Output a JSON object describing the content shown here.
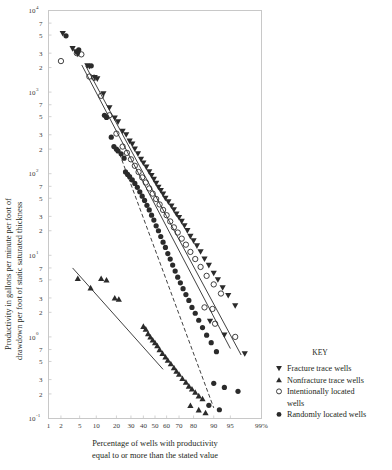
{
  "chart_data": {
    "type": "scatter",
    "title": "",
    "xlabel": "Percentage of wells with productivity equal to or more than the stated value",
    "ylabel": "Productivity in gallons per minute per foot of drawdown per foot of static saturated thickness",
    "x_scale": "probability",
    "y_scale": "log",
    "xlim": [
      1,
      99
    ],
    "ylim": [
      0.1,
      10000
    ],
    "grid": false,
    "legend_position": "right-bottom",
    "xticks": [
      {
        "value": 1,
        "label": "1"
      },
      {
        "value": 2,
        "label": "2"
      },
      {
        "value": 5,
        "label": "5"
      },
      {
        "value": 10,
        "label": "10"
      },
      {
        "value": 20,
        "label": "20"
      },
      {
        "value": 30,
        "label": "30"
      },
      {
        "value": 40,
        "label": "40"
      },
      {
        "value": 50,
        "label": "50"
      },
      {
        "value": 60,
        "label": "60"
      },
      {
        "value": 70,
        "label": "70"
      },
      {
        "value": 80,
        "label": "80"
      },
      {
        "value": 90,
        "label": "90"
      },
      {
        "value": 95,
        "label": "95"
      },
      {
        "value": 99,
        "label": "99%"
      }
    ],
    "yticks": [
      {
        "value": 10000,
        "label": "10",
        "exponent": "4"
      },
      {
        "value": 7000,
        "label": "7"
      },
      {
        "value": 5000,
        "label": "5"
      },
      {
        "value": 3000,
        "label": "3"
      },
      {
        "value": 2000,
        "label": "2"
      },
      {
        "value": 1000,
        "label": "10",
        "exponent": "3"
      },
      {
        "value": 700,
        "label": "7"
      },
      {
        "value": 500,
        "label": "5"
      },
      {
        "value": 300,
        "label": "3"
      },
      {
        "value": 200,
        "label": "2"
      },
      {
        "value": 100,
        "label": "10",
        "exponent": "2"
      },
      {
        "value": 70,
        "label": "7"
      },
      {
        "value": 50,
        "label": "5"
      },
      {
        "value": 30,
        "label": "3"
      },
      {
        "value": 20,
        "label": "2"
      },
      {
        "value": 10,
        "label": "10",
        "exponent": "1"
      },
      {
        "value": 7,
        "label": "7"
      },
      {
        "value": 5,
        "label": "5"
      },
      {
        "value": 3,
        "label": "3"
      },
      {
        "value": 2,
        "label": "2"
      },
      {
        "value": 1,
        "label": "10",
        "exponent": "0"
      },
      {
        "value": 0.7,
        "label": "7"
      },
      {
        "value": 0.5,
        "label": "5"
      },
      {
        "value": 0.3,
        "label": "3"
      },
      {
        "value": 0.2,
        "label": "2"
      },
      {
        "value": 0.1,
        "label": "10",
        "exponent": "-1"
      }
    ],
    "series": [
      {
        "name": "Fracture trace wells",
        "marker": "triangle-down",
        "fill": "#2b2b2b",
        "points": [
          [
            2.2,
            5200
          ],
          [
            3.6,
            3400
          ],
          [
            4.2,
            3100
          ],
          [
            4.6,
            2900
          ],
          [
            7.0,
            2100
          ],
          [
            7.6,
            2050
          ],
          [
            9.4,
            1500
          ],
          [
            10.4,
            1450
          ],
          [
            13.0,
            950
          ],
          [
            16.0,
            640
          ],
          [
            19.0,
            480
          ],
          [
            21.0,
            430
          ],
          [
            24.0,
            330
          ],
          [
            26.5,
            300
          ],
          [
            29.0,
            250
          ],
          [
            31.0,
            230
          ],
          [
            33.0,
            200
          ],
          [
            35.5,
            175
          ],
          [
            38.0,
            150
          ],
          [
            40.0,
            135
          ],
          [
            42.5,
            120
          ],
          [
            45.0,
            105
          ],
          [
            47.0,
            95
          ],
          [
            49.0,
            85
          ],
          [
            51.0,
            76
          ],
          [
            53.0,
            68
          ],
          [
            55.0,
            62
          ],
          [
            57.0,
            56
          ],
          [
            59.0,
            50
          ],
          [
            61.5,
            45
          ],
          [
            64.0,
            40
          ],
          [
            66.0,
            36
          ],
          [
            68.0,
            32
          ],
          [
            70.0,
            29
          ],
          [
            72.0,
            26
          ],
          [
            74.0,
            23
          ],
          [
            76.0,
            20
          ],
          [
            78.0,
            17
          ],
          [
            80.0,
            15
          ],
          [
            82.0,
            13
          ],
          [
            84.0,
            11
          ],
          [
            86.0,
            9.0
          ],
          [
            88.0,
            7.5
          ],
          [
            90.0,
            6.0
          ],
          [
            91.5,
            5.0
          ],
          [
            93.0,
            4.0
          ],
          [
            94.5,
            3.2
          ],
          [
            96.0,
            2.4
          ],
          [
            88.5,
            1.55
          ],
          [
            93.5,
            1.05
          ],
          [
            97.5,
            0.62
          ]
        ]
      },
      {
        "name": "Nonfracture trace wells",
        "marker": "triangle-up",
        "fill": "#2b2b2b",
        "points": [
          [
            4.6,
            5.2
          ],
          [
            8.0,
            4.0
          ],
          [
            12.0,
            5.2
          ],
          [
            14.5,
            5.0
          ],
          [
            19.0,
            3.0
          ],
          [
            21.5,
            2.9
          ],
          [
            40.0,
            1.35
          ],
          [
            42.0,
            1.25
          ],
          [
            44.0,
            1.1
          ],
          [
            46.0,
            1.0
          ],
          [
            48.0,
            0.92
          ],
          [
            50.0,
            0.85
          ],
          [
            52.0,
            0.78
          ],
          [
            54.0,
            0.7
          ],
          [
            56.5,
            0.63
          ],
          [
            59.0,
            0.57
          ],
          [
            61.0,
            0.52
          ],
          [
            63.5,
            0.47
          ],
          [
            66.0,
            0.42
          ],
          [
            68.0,
            0.38
          ],
          [
            70.0,
            0.35
          ],
          [
            72.5,
            0.31
          ],
          [
            75.0,
            0.28
          ],
          [
            77.0,
            0.25
          ],
          [
            79.0,
            0.23
          ],
          [
            81.0,
            0.21
          ],
          [
            83.0,
            0.19
          ],
          [
            85.0,
            0.175
          ],
          [
            78.0,
            0.145
          ],
          [
            83.0,
            0.128
          ],
          [
            86.5,
            0.118
          ]
        ]
      },
      {
        "name": "Intentionally located wells",
        "marker": "circle-open",
        "fill": "none",
        "points": [
          [
            2.0,
            2400
          ],
          [
            4.4,
            3000
          ],
          [
            5.4,
            2900
          ],
          [
            7.6,
            1550
          ],
          [
            9.2,
            1500
          ],
          [
            12.0,
            900
          ],
          [
            16.0,
            520
          ],
          [
            20.0,
            310
          ],
          [
            24.0,
            215
          ],
          [
            27.0,
            180
          ],
          [
            30.0,
            150
          ],
          [
            33.0,
            125
          ],
          [
            36.0,
            105
          ],
          [
            39.0,
            90
          ],
          [
            42.0,
            78
          ],
          [
            45.0,
            66
          ],
          [
            48.0,
            57
          ],
          [
            51.0,
            49
          ],
          [
            54.0,
            42
          ],
          [
            57.0,
            36
          ],
          [
            60.0,
            31
          ],
          [
            63.0,
            26
          ],
          [
            66.0,
            22
          ],
          [
            69.0,
            19
          ],
          [
            72.0,
            16
          ],
          [
            75.0,
            13.5
          ],
          [
            78.0,
            11.0
          ],
          [
            81.0,
            9.0
          ],
          [
            84.0,
            7.2
          ],
          [
            87.0,
            5.6
          ],
          [
            90.0,
            4.4
          ],
          [
            92.5,
            3.4
          ],
          [
            86.0,
            2.3
          ],
          [
            89.5,
            2.2
          ],
          [
            90.5,
            1.45
          ],
          [
            96.0,
            1.0
          ]
        ]
      },
      {
        "name": "Randomly located wells",
        "marker": "circle-filled",
        "fill": "#2b2b2b",
        "points": [
          [
            2.6,
            4900
          ],
          [
            4.8,
            3300
          ],
          [
            8.2,
            2100
          ],
          [
            13.5,
            520
          ],
          [
            14.5,
            490
          ],
          [
            17.0,
            280
          ],
          [
            18.5,
            215
          ],
          [
            20.0,
            200
          ],
          [
            21.0,
            190
          ],
          [
            23.0,
            175
          ],
          [
            25.0,
            155
          ],
          [
            26.0,
            105
          ],
          [
            27.5,
            98
          ],
          [
            29.0,
            92
          ],
          [
            31.0,
            84
          ],
          [
            33.0,
            76
          ],
          [
            35.0,
            68
          ],
          [
            37.0,
            60
          ],
          [
            39.0,
            53
          ],
          [
            41.0,
            47
          ],
          [
            43.0,
            41
          ],
          [
            45.0,
            36
          ],
          [
            47.0,
            31
          ],
          [
            49.0,
            27
          ],
          [
            51.0,
            23
          ],
          [
            53.0,
            20
          ],
          [
            55.0,
            17
          ],
          [
            57.0,
            14.5
          ],
          [
            59.0,
            12.5
          ],
          [
            61.0,
            10.5
          ],
          [
            63.0,
            9.0
          ],
          [
            65.0,
            7.6
          ],
          [
            67.0,
            6.4
          ],
          [
            69.0,
            5.4
          ],
          [
            71.0,
            4.6
          ],
          [
            73.0,
            3.9
          ],
          [
            75.0,
            3.3
          ],
          [
            77.0,
            2.8
          ],
          [
            79.0,
            2.3
          ],
          [
            81.0,
            1.95
          ],
          [
            83.0,
            1.6
          ],
          [
            85.0,
            1.3
          ],
          [
            87.0,
            1.05
          ],
          [
            89.0,
            0.85
          ],
          [
            91.0,
            0.66
          ],
          [
            90.0,
            0.27
          ],
          [
            93.5,
            0.24
          ],
          [
            96.5,
            0.215
          ],
          [
            88.0,
            0.145
          ],
          [
            92.0,
            0.128
          ]
        ]
      }
    ],
    "trend_lines": [
      {
        "name": "fracture-trace-trend",
        "style": "solid",
        "from": [
          6.5,
          2100
        ],
        "to": [
          97.0,
          0.6
        ]
      },
      {
        "name": "intentionally-located-trend",
        "style": "solid",
        "from": [
          5.5,
          2150
        ],
        "to": [
          95.0,
          0.72
        ]
      },
      {
        "name": "randomly-located-trend",
        "style": "dashed",
        "from": [
          22.0,
          175
        ],
        "to": [
          90.0,
          0.135
        ]
      },
      {
        "name": "nonfracture-trace-trend",
        "style": "solid",
        "from": [
          3.6,
          7.0
        ],
        "to": [
          57.0,
          0.4
        ]
      }
    ]
  },
  "axis": {
    "y_title_line1": "Productivity in gallons per minute per foot of",
    "y_title_line2": "drawdown per foot of static saturated thickness",
    "x_title_line1": "Percentage of wells with productivity",
    "x_title_line2": "equal to or more than the stated value"
  },
  "legend": {
    "title": "KEY",
    "items": [
      {
        "label": "Fracture trace wells",
        "marker": "triangle-down"
      },
      {
        "label": "Nonfracture trace wells",
        "marker": "triangle-up"
      },
      {
        "label": "Intentionally located",
        "label2": "wells",
        "marker": "circle-open"
      },
      {
        "label": "Randomly located wells",
        "marker": "circle-filled"
      }
    ]
  },
  "colors": {
    "ink": "#231f20",
    "marker": "#2b2b2b",
    "frame": "#c8c8c8",
    "tick_text": "#3a3a3a",
    "background": "#ffffff"
  }
}
